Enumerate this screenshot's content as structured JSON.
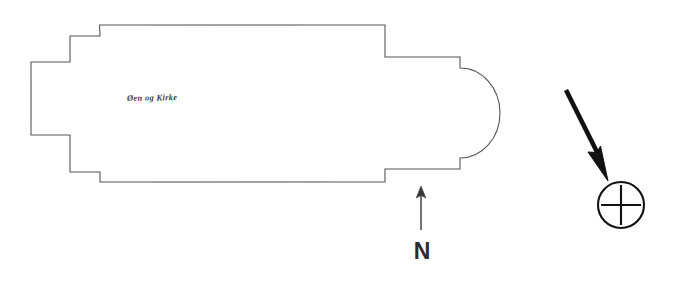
{
  "document": {
    "kind": "scanned-architectural-floor-plan",
    "subject": "church-ground-plan-with-apse",
    "background_color": "#ffffff",
    "ink_color": "#3a3a3a",
    "marker_color": "#111111"
  },
  "plan": {
    "annotation_text": "Øen og Kirke",
    "outline_stroke_color": "#555555",
    "outline_stroke_width": "1.1"
  },
  "north_indicator": {
    "label": "N",
    "label_color": "#2b2b2b",
    "arrow_color": "#3a3a3a",
    "direction": "up"
  },
  "location_marker": {
    "symbol": "circled-plus",
    "symbol_color": "#111111",
    "pointer": "thick-diagonal-arrow",
    "pointer_direction": "down-right"
  }
}
